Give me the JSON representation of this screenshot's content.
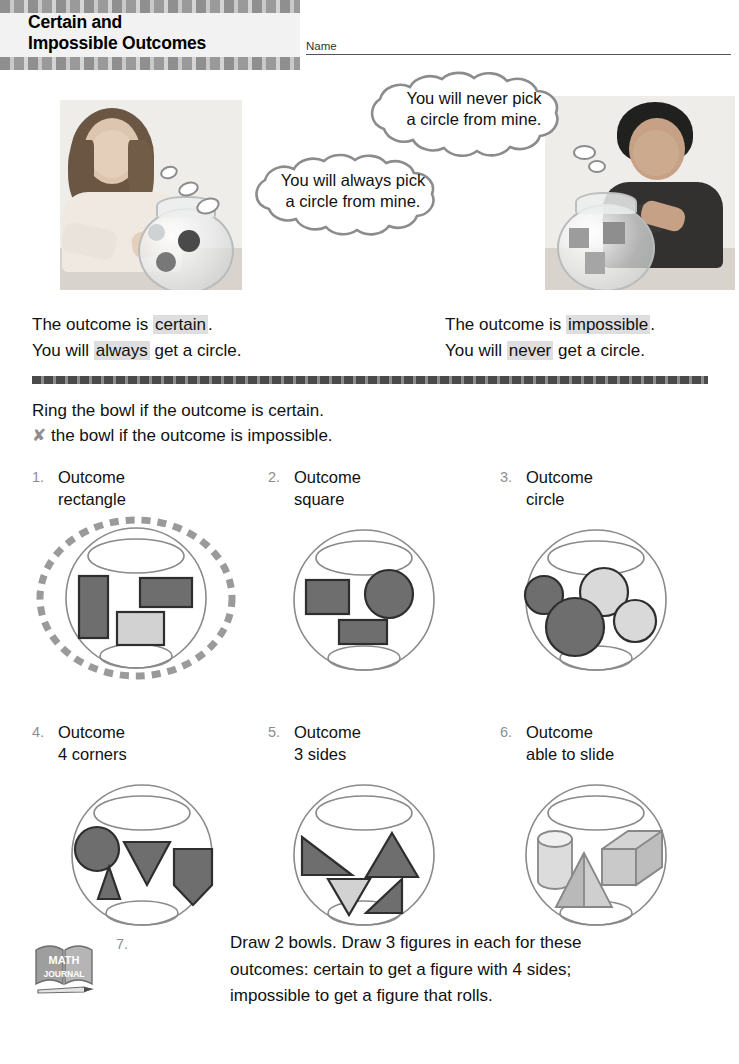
{
  "header": {
    "title_line1": "Certain and",
    "title_line2": "Impossible Outcomes",
    "name_label": "Name"
  },
  "scene": {
    "bubble_right": {
      "line1": "You will never pick",
      "line2": "a circle from mine."
    },
    "bubble_left": {
      "line1": "You will always pick",
      "line2": "a circle from mine."
    },
    "photo_left_alt": "girl-with-fishbowl-of-circles",
    "photo_right_alt": "boy-with-fishbowl-of-squares"
  },
  "statements": {
    "left": {
      "l1_pre": "The outcome is ",
      "l1_hl": "certain",
      "l1_post": ".",
      "l2_pre": "You will ",
      "l2_hl": "always",
      "l2_post": " get a circle."
    },
    "right": {
      "l1_pre": "The outcome is ",
      "l1_hl": "impossible",
      "l1_post": ".",
      "l2_pre": "You will ",
      "l2_hl": "never",
      "l2_post": " get a circle."
    }
  },
  "directions": {
    "line1": "Ring the bowl if the outcome is certain.",
    "x_glyph": "✘",
    "line2": "the bowl if the outcome is impossible."
  },
  "problems": [
    {
      "num": "1.",
      "label": "Outcome",
      "outcome": "rectangle",
      "ringed": true,
      "contents": [
        "rectangle-tall-dark",
        "rectangle-wide-dark",
        "rectangle-wide-light"
      ]
    },
    {
      "num": "2.",
      "label": "Outcome",
      "outcome": "square",
      "ringed": false,
      "contents": [
        "rectangle-dark",
        "circle-dark",
        "rectangle-wide-dark"
      ]
    },
    {
      "num": "3.",
      "label": "Outcome",
      "outcome": "circle",
      "ringed": false,
      "contents": [
        "circle-dark-small",
        "circle-light",
        "circle-dark-large",
        "circle-light-small"
      ]
    },
    {
      "num": "4.",
      "label": "Outcome",
      "outcome": "4 corners",
      "ringed": false,
      "contents": [
        "circle-dark",
        "triangle-down-dark",
        "triangle-up-dark",
        "pentagon-dark"
      ]
    },
    {
      "num": "5.",
      "label": "Outcome",
      "outcome": "3 sides",
      "ringed": false,
      "contents": [
        "triangle-right-dark",
        "triangle-up-dark",
        "triangle-down-light",
        "triangle-right-dark"
      ]
    },
    {
      "num": "6.",
      "label": "Outcome",
      "outcome": "able to slide",
      "ringed": false,
      "contents": [
        "cylinder",
        "cube",
        "pyramid"
      ]
    }
  ],
  "journal": {
    "icon_line1": "MATH",
    "icon_line2": "JOURNAL",
    "num": "7.",
    "line1": "Draw 2 bowls. Draw 3 figures in each for these",
    "line2": "outcomes: certain to get a figure with 4 sides;",
    "line3": "impossible to get a figure that rolls."
  },
  "colors": {
    "shape_dark": "#6e6e6e",
    "shape_light": "#d2d2d2",
    "shape_outline": "#2e2e2e",
    "bowl_outline": "#8a8a8a",
    "ring_gray": "#9a9a9a",
    "number_gray": "#8d8d8d",
    "highlight_bg": "#dedede"
  }
}
